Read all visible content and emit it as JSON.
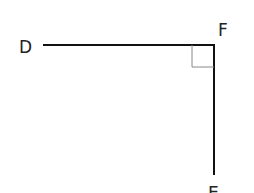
{
  "diagram": {
    "labels": {
      "d": "D",
      "f": "F",
      "e": "E"
    },
    "segments": [
      {
        "name": "DF",
        "from": "D",
        "to": "F"
      },
      {
        "name": "FE",
        "from": "F",
        "to": "E"
      }
    ],
    "right_angle_at": "F",
    "colors": {
      "line": "#111111",
      "right_angle_marker": "#888888",
      "text": "#222222"
    }
  }
}
